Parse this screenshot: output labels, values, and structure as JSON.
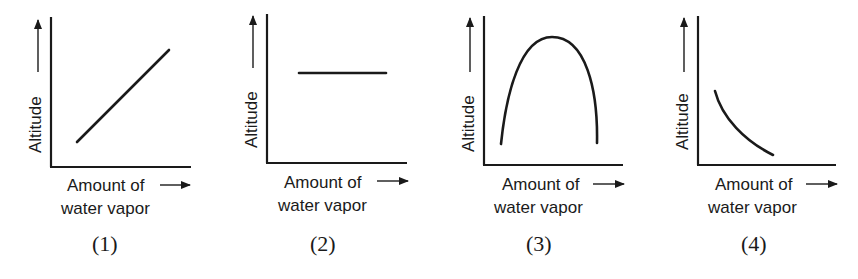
{
  "graphs": [
    {
      "number": "(1)",
      "y_label": "Altitude",
      "x_label_line1": "Amount of",
      "x_label_line2": "water vapor",
      "shape": "increasing-linear"
    },
    {
      "number": "(2)",
      "y_label": "Altitude",
      "x_label_line1": "Amount of",
      "x_label_line2": "water vapor",
      "shape": "constant-horizontal"
    },
    {
      "number": "(3)",
      "y_label": "Altitude",
      "x_label_line1": "Amount of",
      "x_label_line2": "water vapor",
      "shape": "inverted-u"
    },
    {
      "number": "(4)",
      "y_label": "Altitude",
      "x_label_line1": "Amount of",
      "x_label_line2": "water vapor",
      "shape": "decreasing-concave"
    }
  ],
  "colors": {
    "ink": "#1a1a1a",
    "background": "#ffffff"
  }
}
